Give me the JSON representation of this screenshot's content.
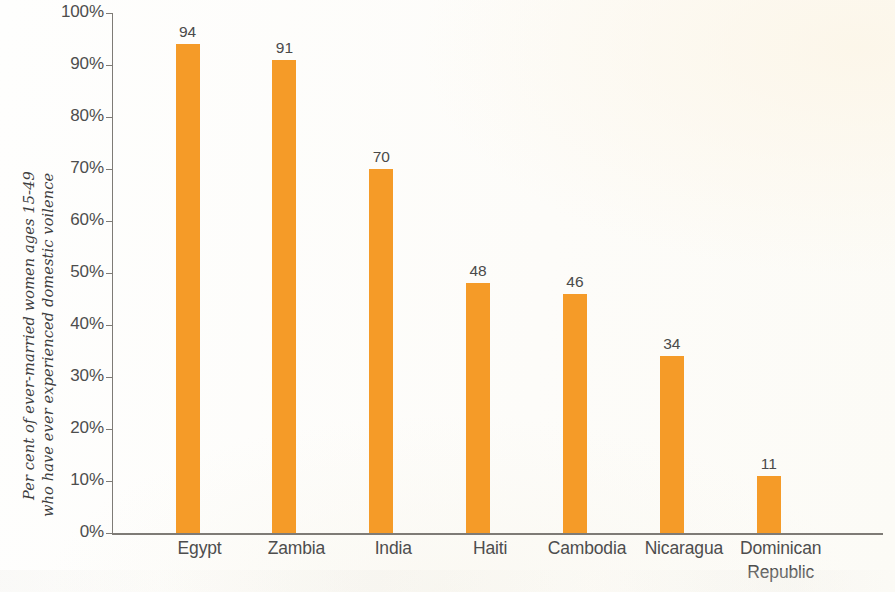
{
  "chart_data": {
    "type": "bar",
    "title": "",
    "subtitle": "",
    "xlabel": "",
    "ylabel_line1": "Per cent of ever-married women ages 15-49",
    "ylabel_line2": "who have ever experienced domestic voilence",
    "categories": [
      "Egypt",
      "Zambia",
      "India",
      "Haiti",
      "Cambodia",
      "Nicaragua",
      "Dominican Republic"
    ],
    "category_lines": [
      [
        "Egypt"
      ],
      [
        "Zambia"
      ],
      [
        "India"
      ],
      [
        "Haiti"
      ],
      [
        "Cambodia"
      ],
      [
        "Nicaragua"
      ],
      [
        "Dominican",
        "Republic"
      ]
    ],
    "values": [
      94,
      91,
      70,
      48,
      46,
      34,
      11
    ],
    "value_labels": [
      "94",
      "91",
      "70",
      "48",
      "46",
      "34",
      "11"
    ],
    "ylim": [
      0,
      100
    ],
    "ytick_values": [
      100,
      90,
      80,
      70,
      60,
      50,
      40,
      30,
      20,
      10,
      0
    ],
    "ytick_labels": [
      "100%",
      "90%",
      "80%",
      "70%",
      "60%",
      "50%",
      "40%",
      "30%",
      "20%",
      "10%",
      "0%"
    ],
    "grid": false,
    "legend": false,
    "legend_position": "none",
    "bar_color": "#f59b28",
    "axis_color": "#7e7b76",
    "text_color": "#4d4d4d",
    "background_color": "#fdfdfb",
    "bar_width_px": 24,
    "orientation": "vertical"
  }
}
